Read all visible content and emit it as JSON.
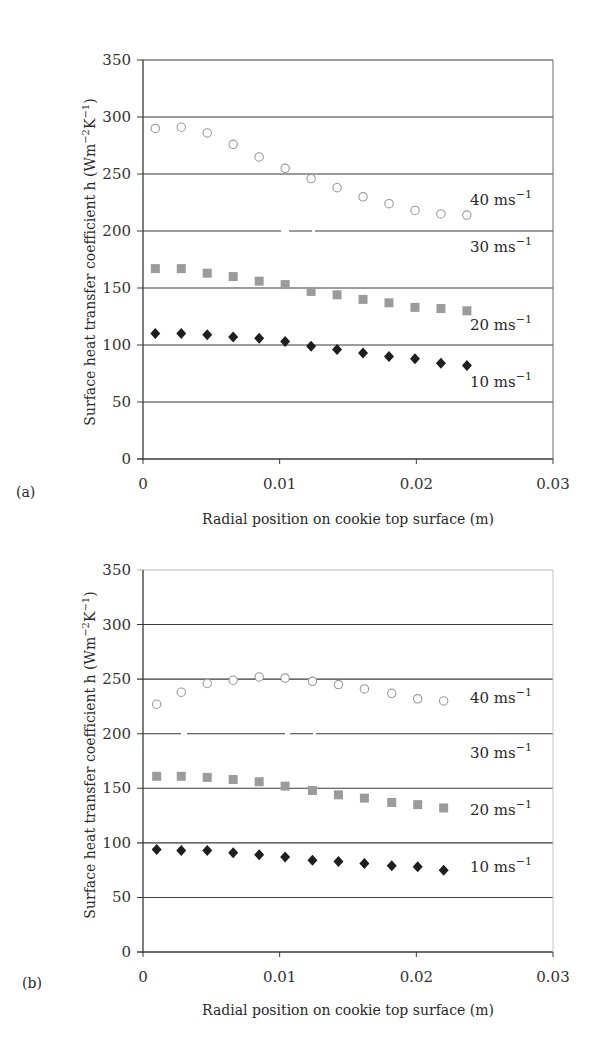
{
  "figure": {
    "panels": [
      {
        "panel_label": "(a)",
        "xlabel": "Radial position on cookie top surface (m)",
        "ylabel": "Surface heat transfer coefficient h (Wm",
        "ylabel_unit_sup1": "−2",
        "ylabel_unit_mid": "K",
        "ylabel_unit_sup2": "−1",
        "ylabel_unit_end": ")",
        "xticks": [
          "0",
          "0.01",
          "0.02",
          "0.03"
        ],
        "yticks": [
          "0",
          "50",
          "100",
          "150",
          "200",
          "250",
          "300",
          "350"
        ],
        "series_labels": [
          {
            "base": "40 ms",
            "sup": "−1"
          },
          {
            "base": "30 ms",
            "sup": "−1"
          },
          {
            "base": "20 ms",
            "sup": "−1"
          },
          {
            "base": "10 ms",
            "sup": "−1"
          }
        ]
      },
      {
        "panel_label": "(b)",
        "xlabel": "Radial position on cookie top surface (m)",
        "ylabel": "Surface heat transfer coefficient h (Wm",
        "ylabel_unit_sup1": "−2",
        "ylabel_unit_mid": "K",
        "ylabel_unit_sup2": "−1",
        "ylabel_unit_end": ")",
        "xticks": [
          "0",
          "0.01",
          "0.02",
          "0.03"
        ],
        "yticks": [
          "0",
          "50",
          "100",
          "150",
          "200",
          "250",
          "300",
          "350"
        ],
        "series_labels": [
          {
            "base": "40 ms",
            "sup": "−1"
          },
          {
            "base": "30 ms",
            "sup": "−1"
          },
          {
            "base": "20 ms",
            "sup": "−1"
          },
          {
            "base": "10 ms",
            "sup": "−1"
          }
        ]
      }
    ]
  },
  "colors": {
    "grid": "#3a3a3a",
    "axis": "#3a3a3a",
    "marker_40": "#9a9a9a",
    "marker_20": "#9b9b9b",
    "marker_10": "#1e1e1e",
    "marker_30": "#ffffff"
  },
  "chart_data": [
    {
      "type": "scatter",
      "title": "(a)",
      "xlabel": "Radial position on cookie top surface (m)",
      "ylabel": "Surface heat transfer coefficient h (Wm^-2K^-1)",
      "xlim": [
        0,
        0.03
      ],
      "ylim": [
        0,
        350
      ],
      "xticks": [
        0,
        0.01,
        0.02,
        0.03
      ],
      "yticks": [
        0,
        50,
        100,
        150,
        200,
        250,
        300,
        350
      ],
      "grid": "horizontal",
      "legend": "inline labels at right",
      "series": [
        {
          "name": "40 ms-1",
          "marker": "open circle",
          "x": [
            0.0009,
            0.0028,
            0.0047,
            0.0066,
            0.0085,
            0.0104,
            0.0123,
            0.0142,
            0.0161,
            0.018,
            0.0199,
            0.0218,
            0.0237
          ],
          "values": [
            290,
            291,
            286,
            276,
            265,
            255,
            246,
            238,
            230,
            224,
            218,
            215,
            214
          ]
        },
        {
          "name": "30 ms-1",
          "marker": "white (not visible)",
          "x": [],
          "values": []
        },
        {
          "name": "20 ms-1",
          "marker": "gray square",
          "x": [
            0.0009,
            0.0028,
            0.0047,
            0.0066,
            0.0085,
            0.0104,
            0.0123,
            0.0142,
            0.0161,
            0.018,
            0.0199,
            0.0218,
            0.0237
          ],
          "values": [
            167,
            167,
            163,
            160,
            156,
            153,
            147,
            144,
            140,
            137,
            133,
            132,
            130
          ]
        },
        {
          "name": "10 ms-1",
          "marker": "black diamond",
          "x": [
            0.0009,
            0.0028,
            0.0047,
            0.0066,
            0.0085,
            0.0104,
            0.0123,
            0.0142,
            0.0161,
            0.018,
            0.0199,
            0.0218,
            0.0237
          ],
          "values": [
            110,
            110,
            109,
            107,
            106,
            103,
            99,
            96,
            93,
            90,
            88,
            84,
            82
          ]
        }
      ]
    },
    {
      "type": "scatter",
      "title": "(b)",
      "xlabel": "Radial position on cookie top surface (m)",
      "ylabel": "Surface heat transfer coefficient h (Wm^-2K^-1)",
      "xlim": [
        0,
        0.03
      ],
      "ylim": [
        0,
        350
      ],
      "xticks": [
        0,
        0.01,
        0.02,
        0.03
      ],
      "yticks": [
        0,
        50,
        100,
        150,
        200,
        250,
        300,
        350
      ],
      "grid": "horizontal",
      "legend": "inline labels at right",
      "series": [
        {
          "name": "40 ms-1",
          "marker": "open circle",
          "x": [
            0.001,
            0.0028,
            0.0047,
            0.0066,
            0.0085,
            0.0104,
            0.0124,
            0.0143,
            0.0162,
            0.0182,
            0.0201,
            0.022
          ],
          "values": [
            227,
            238,
            246,
            249,
            252,
            251,
            248,
            245,
            241,
            237,
            232,
            230
          ]
        },
        {
          "name": "30 ms-1",
          "marker": "white (not visible)",
          "x": [],
          "values": []
        },
        {
          "name": "20 ms-1",
          "marker": "gray square",
          "x": [
            0.001,
            0.0028,
            0.0047,
            0.0066,
            0.0085,
            0.0104,
            0.0124,
            0.0143,
            0.0162,
            0.0182,
            0.0201,
            0.022
          ],
          "values": [
            161,
            161,
            160,
            158,
            156,
            152,
            148,
            144,
            141,
            137,
            135,
            132
          ]
        },
        {
          "name": "10 ms-1",
          "marker": "black diamond",
          "x": [
            0.001,
            0.0028,
            0.0047,
            0.0066,
            0.0085,
            0.0104,
            0.0124,
            0.0143,
            0.0162,
            0.0182,
            0.0201,
            0.022
          ],
          "values": [
            94,
            93,
            93,
            91,
            89,
            87,
            84,
            83,
            81,
            79,
            78,
            75
          ]
        }
      ]
    }
  ]
}
